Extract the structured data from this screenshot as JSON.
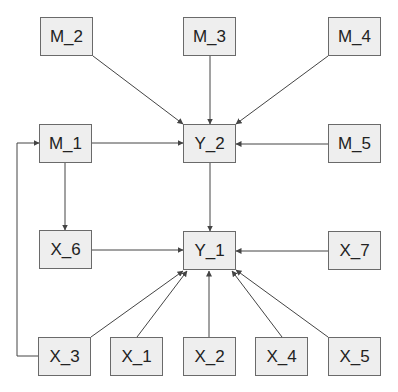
{
  "diagram": {
    "type": "path-diagram",
    "nodes": [
      {
        "id": "M_2",
        "label": "M_2",
        "x": 40,
        "y": 17,
        "w": 53,
        "h": 39
      },
      {
        "id": "M_3",
        "label": "M_3",
        "x": 183,
        "y": 17,
        "w": 53,
        "h": 39
      },
      {
        "id": "M_4",
        "label": "M_4",
        "x": 328,
        "y": 17,
        "w": 53,
        "h": 39
      },
      {
        "id": "M_1",
        "label": "M_1",
        "x": 39,
        "y": 124,
        "w": 53,
        "h": 39
      },
      {
        "id": "Y_2",
        "label": "Y_2",
        "x": 183,
        "y": 124,
        "w": 53,
        "h": 39
      },
      {
        "id": "M_5",
        "label": "M_5",
        "x": 328,
        "y": 124,
        "w": 53,
        "h": 39
      },
      {
        "id": "X_6",
        "label": "X_6",
        "x": 39,
        "y": 230,
        "w": 53,
        "h": 39
      },
      {
        "id": "Y_1",
        "label": "Y_1",
        "x": 183,
        "y": 231,
        "w": 53,
        "h": 39
      },
      {
        "id": "X_7",
        "label": "X_7",
        "x": 328,
        "y": 231,
        "w": 53,
        "h": 39
      },
      {
        "id": "X_3",
        "label": "X_3",
        "x": 38,
        "y": 337,
        "w": 53,
        "h": 39
      },
      {
        "id": "X_1",
        "label": "X_1",
        "x": 110,
        "y": 337,
        "w": 53,
        "h": 39
      },
      {
        "id": "X_2",
        "label": "X_2",
        "x": 183,
        "y": 337,
        "w": 53,
        "h": 39
      },
      {
        "id": "X_4",
        "label": "X_4",
        "x": 255,
        "y": 337,
        "w": 53,
        "h": 39
      },
      {
        "id": "X_5",
        "label": "X_5",
        "x": 328,
        "y": 337,
        "w": 53,
        "h": 39
      }
    ],
    "edges": [
      {
        "from": "M_2",
        "to": "Y_2"
      },
      {
        "from": "M_3",
        "to": "Y_2"
      },
      {
        "from": "M_4",
        "to": "Y_2"
      },
      {
        "from": "M_1",
        "to": "Y_2"
      },
      {
        "from": "M_5",
        "to": "Y_2"
      },
      {
        "from": "M_1",
        "to": "X_6"
      },
      {
        "from": "Y_2",
        "to": "Y_1"
      },
      {
        "from": "X_6",
        "to": "Y_1"
      },
      {
        "from": "X_7",
        "to": "Y_1"
      },
      {
        "from": "X_3",
        "to": "Y_1"
      },
      {
        "from": "X_1",
        "to": "Y_1"
      },
      {
        "from": "X_2",
        "to": "Y_1"
      },
      {
        "from": "X_4",
        "to": "Y_1"
      },
      {
        "from": "X_5",
        "to": "Y_1"
      },
      {
        "from": "X_3",
        "to": "M_1",
        "routing": "orthogonal-left-loop"
      }
    ],
    "colors": {
      "node_fill": "#eeeeee",
      "node_border": "#6a6a6a",
      "edge": "#444444",
      "text": "#222222"
    }
  }
}
